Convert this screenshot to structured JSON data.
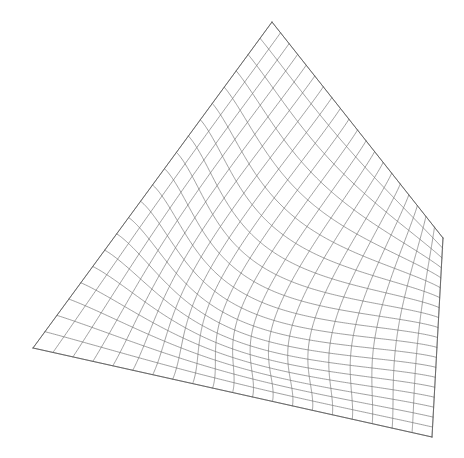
{
  "figure": {
    "name": "hyperbolic-paraboloid-wireframe",
    "type": "3d-surface-wireframe",
    "background_color": "#ffffff",
    "line_color": "#6e6e6e",
    "silhouette_color": "#5a5a5a",
    "line_width": 0.65,
    "canvas": {
      "width": 464,
      "height": 458
    }
  },
  "chart_data": {
    "type": "line",
    "title": "",
    "xlabel": "",
    "ylabel": "",
    "zlabel": "",
    "surface": "hyperbolic paraboloid z = x*y (saddle)",
    "grid": true,
    "legend": null,
    "u_range": [
      -1,
      1
    ],
    "v_range": [
      -1,
      1
    ],
    "u_divisions": 20,
    "v_divisions": 20,
    "projection": {
      "mode": "bilinear-corner-warp",
      "corners_px": {
        "top": [
          272,
          22
        ],
        "left": [
          33,
          348
        ],
        "bottom": [
          432,
          437
        ],
        "right": [
          443,
          238
        ]
      },
      "saddle_bulge_px": [
        -48,
        34
      ],
      "warp_strength": 1.0
    },
    "silhouette_edges": [
      {
        "name": "apex-to-left",
        "from": [
          272,
          22
        ],
        "to": [
          33,
          348
        ]
      },
      {
        "name": "apex-to-right",
        "from": [
          272,
          22
        ],
        "to": [
          443,
          238
        ]
      },
      {
        "name": "right-to-bottom",
        "from": [
          443,
          238
        ],
        "to": [
          432,
          437
        ]
      },
      {
        "name": "bottom-to-left",
        "from": [
          432,
          437
        ],
        "to": [
          33,
          348
        ]
      }
    ]
  },
  "labels": {
    "figure_caption": "",
    "axis_ticks": []
  }
}
